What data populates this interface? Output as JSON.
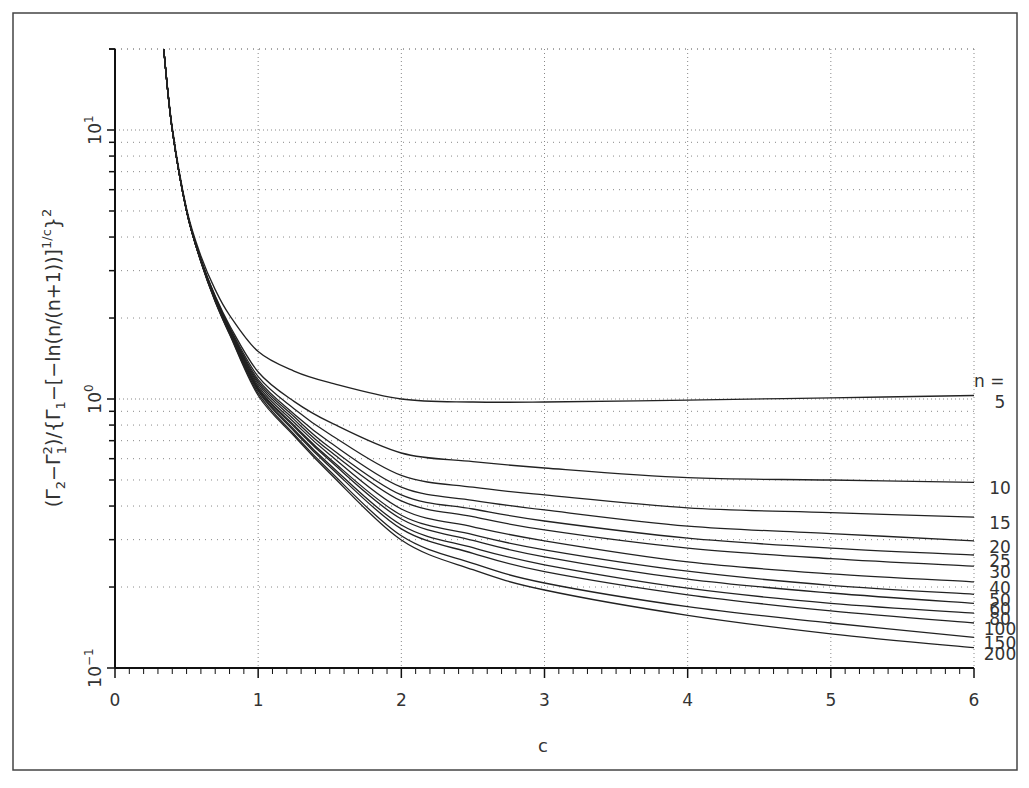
{
  "chart_data": {
    "type": "line",
    "title": "",
    "xlabel": "c",
    "ylabel": "(Γ₂−Γ₁²)/{Γ₁−[−ln(n/(n+1))]^(1/c)}²",
    "ylabel_parts": {
      "open": "(Γ",
      "sub2": "2",
      "minus": "−Γ",
      "sup2": "2",
      "sub1": "1",
      "mid": ")/{Γ",
      "sub1b": "1",
      "rest": "−[−ln(n/(n+1))]",
      "sup_exp": "1/c",
      "close": "}",
      "sup_sq": "2"
    },
    "x_scale": "linear",
    "y_scale": "log",
    "xlim": [
      0,
      6
    ],
    "ylim": [
      0.1,
      20
    ],
    "x_ticks": [
      0,
      1,
      2,
      3,
      4,
      5,
      6
    ],
    "x_tick_labels": [
      "0",
      "1",
      "2",
      "3",
      "4",
      "5",
      "6"
    ],
    "x_minor_step": 0.1,
    "y_ticks": [
      0.1,
      1,
      10
    ],
    "y_tick_labels": [
      {
        "base": "10",
        "exp": "−1"
      },
      {
        "base": "10",
        "exp": "0"
      },
      {
        "base": "10",
        "exp": "1"
      }
    ],
    "grid": true,
    "legend_title": "n =",
    "legend_placement": "right, at line ends",
    "x": [
      0.34,
      0.4,
      0.5,
      0.6,
      0.7,
      0.8,
      1.0,
      1.25,
      1.5,
      2.0,
      2.5,
      3.0,
      4.0,
      5.0,
      6.0
    ],
    "series": [
      {
        "name": "5",
        "values": [
          20,
          10.2,
          5.1,
          3.4,
          2.55,
          2.05,
          1.5,
          1.27,
          1.15,
          1.0,
          0.975,
          0.975,
          0.99,
          1.01,
          1.03
        ]
      },
      {
        "name": "10",
        "values": [
          20,
          10.0,
          5.0,
          3.3,
          2.42,
          1.88,
          1.26,
          0.98,
          0.82,
          0.63,
          0.585,
          0.554,
          0.51,
          0.5,
          0.49
        ]
      },
      {
        "name": "15",
        "values": [
          20,
          10.0,
          5.0,
          3.3,
          2.4,
          1.85,
          1.21,
          0.92,
          0.74,
          0.52,
          0.47,
          0.44,
          0.394,
          0.378,
          0.364
        ]
      },
      {
        "name": "20",
        "values": [
          20,
          10.0,
          5.0,
          3.28,
          2.38,
          1.83,
          1.18,
          0.88,
          0.69,
          0.47,
          0.42,
          0.387,
          0.337,
          0.316,
          0.297
        ]
      },
      {
        "name": "25",
        "values": [
          20,
          10.0,
          5.0,
          3.28,
          2.37,
          1.82,
          1.16,
          0.86,
          0.66,
          0.44,
          0.39,
          0.352,
          0.304,
          0.279,
          0.263
        ]
      },
      {
        "name": "30",
        "values": [
          20,
          10.0,
          5.0,
          3.27,
          2.36,
          1.81,
          1.14,
          0.84,
          0.64,
          0.418,
          0.365,
          0.326,
          0.279,
          0.255,
          0.239
        ]
      },
      {
        "name": "40",
        "values": [
          20,
          10.0,
          5.0,
          3.27,
          2.35,
          1.8,
          1.12,
          0.82,
          0.62,
          0.39,
          0.335,
          0.297,
          0.248,
          0.224,
          0.209
        ]
      },
      {
        "name": "50",
        "values": [
          20,
          10.0,
          5.0,
          3.26,
          2.34,
          1.79,
          1.1,
          0.8,
          0.6,
          0.37,
          0.313,
          0.275,
          0.229,
          0.203,
          0.188
        ]
      },
      {
        "name": "60",
        "values": [
          20,
          10.0,
          5.0,
          3.26,
          2.34,
          1.78,
          1.09,
          0.79,
          0.59,
          0.358,
          0.298,
          0.259,
          0.214,
          0.19,
          0.174
        ]
      },
      {
        "name": "80",
        "values": [
          20,
          10.0,
          5.0,
          3.25,
          2.33,
          1.77,
          1.08,
          0.77,
          0.57,
          0.34,
          0.28,
          0.242,
          0.198,
          0.174,
          0.16
        ]
      },
      {
        "name": "100",
        "values": [
          20,
          10.0,
          5.0,
          3.25,
          2.32,
          1.76,
          1.07,
          0.76,
          0.56,
          0.329,
          0.267,
          0.228,
          0.187,
          0.163,
          0.147
        ]
      },
      {
        "name": "150",
        "values": [
          20,
          10.0,
          5.0,
          3.24,
          2.31,
          1.75,
          1.05,
          0.74,
          0.54,
          0.31,
          0.245,
          0.207,
          0.169,
          0.147,
          0.13
        ]
      },
      {
        "name": "200",
        "values": [
          20,
          10.0,
          5.0,
          3.24,
          2.3,
          1.74,
          1.03,
          0.73,
          0.53,
          0.299,
          0.232,
          0.195,
          0.157,
          0.134,
          0.119
        ]
      }
    ]
  }
}
